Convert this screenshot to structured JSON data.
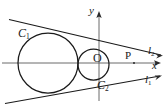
{
  "figure": {
    "kind": "geometry-diagram",
    "width": 167,
    "height": 109,
    "background_color": "#ffffff",
    "stroke_color": "#1a1a1a",
    "axis_color": "#555555"
  },
  "labels": {
    "circle_large": "C",
    "circle_large_sub": "1",
    "circle_small": "C",
    "circle_small_sub": "2",
    "origin": "O",
    "point_p": "P",
    "axis_y": "y",
    "axis_x": "x",
    "line_lower": "l",
    "line_lower_sub": "1",
    "line_upper": "l",
    "line_upper_sub": "2"
  },
  "geometry": {
    "axes": {
      "x_axis": {
        "x1": 2,
        "y1": 63,
        "x2": 160,
        "y2": 63,
        "arrow": "right"
      },
      "y_axis": {
        "x1": 99,
        "y1": 100,
        "x2": 99,
        "y2": 12,
        "arrow": "up"
      },
      "origin": {
        "x": 99,
        "y": 63
      }
    },
    "circle_large": {
      "cx": 48,
      "cy": 63,
      "r": 30
    },
    "circle_small": {
      "cx": 93.5,
      "cy": 64.5,
      "r": 15.5
    },
    "point_p": {
      "x": 134,
      "y": 63
    },
    "line_upper": {
      "x1": 10,
      "y1": 20,
      "x2": 160,
      "y2": 55
    },
    "line_lower": {
      "x1": 6,
      "y1": 103,
      "x2": 158,
      "y2": 76
    }
  }
}
